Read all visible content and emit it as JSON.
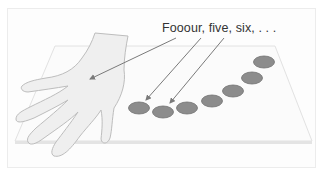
{
  "figure": {
    "caption": "Fooour, five, six, . . .",
    "elements": {
      "hand": "hand-icon",
      "table": "tabletop",
      "counters_count": 7
    },
    "colors": {
      "background": "#ffffff",
      "frame_border": "#ececec",
      "table_fill": "#fbfbfb",
      "table_edge": "#dcdcdc",
      "hand_fill": "#eeeeee",
      "hand_stroke": "#b8b8b8",
      "counter_fill": "#8a8a8a",
      "counter_stroke": "#6e6e6e",
      "arrow": "#7a7a7a",
      "text": "#333333"
    }
  }
}
